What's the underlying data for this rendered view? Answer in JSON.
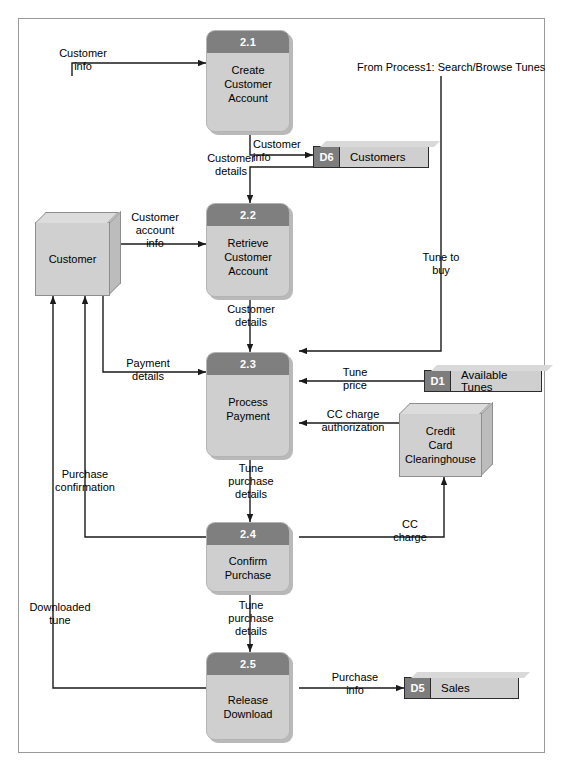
{
  "diagram": {
    "note_top_right": "From Process1: Search/Browse Tunes"
  },
  "colors": {
    "process_header": "#7f7f7f",
    "process_body": "#cfcfcf",
    "entity_fill": "#d0d0d0",
    "store_id_fill": "#7d7d7d",
    "store_name_fill": "#cfcfcf",
    "line": "#1a1a1a",
    "frame_border": "#9a9a9a"
  },
  "processes": [
    {
      "id": "2.1",
      "name": "Create\nCustomer\nAccount"
    },
    {
      "id": "2.2",
      "name": "Retrieve\nCustomer\nAccount"
    },
    {
      "id": "2.3",
      "name": "Process\nPayment"
    },
    {
      "id": "2.4",
      "name": "Confirm\nPurchase"
    },
    {
      "id": "2.5",
      "name": "Release\nDownload"
    }
  ],
  "entities": [
    {
      "key": "customer",
      "name": "Customer"
    },
    {
      "key": "cc_clearinghouse",
      "name": "Credit\nCard\nClearinghouse"
    }
  ],
  "datastores": [
    {
      "id": "D6",
      "name": "Customers"
    },
    {
      "id": "D1",
      "name": "Available Tunes"
    },
    {
      "id": "D5",
      "name": "Sales"
    }
  ],
  "flows": [
    {
      "key": "customer_info_in",
      "label": "Customer\ninfo",
      "from": "customer",
      "to": "2.1"
    },
    {
      "key": "customer_info_store",
      "label": "Customer\ninfo",
      "from": "2.1",
      "to": "D6"
    },
    {
      "key": "customer_details_d6",
      "label": "Customer\ndetails",
      "from": "D6",
      "to": "2.2"
    },
    {
      "key": "customer_account_info",
      "label": "Customer\naccount\ninfo",
      "from": "customer",
      "to": "2.2"
    },
    {
      "key": "customer_details_23",
      "label": "Customer\ndetails",
      "from": "2.2",
      "to": "2.3"
    },
    {
      "key": "tune_to_buy",
      "label": "Tune to\nbuy",
      "from": "Process1",
      "to": "2.3"
    },
    {
      "key": "payment_details",
      "label": "Payment\ndetails",
      "from": "customer",
      "to": "2.3"
    },
    {
      "key": "tune_price",
      "label": "Tune\nprice",
      "from": "D1",
      "to": "2.3"
    },
    {
      "key": "cc_charge_auth",
      "label": "CC charge\nauthorization",
      "from": "cc_clearinghouse",
      "to": "2.3"
    },
    {
      "key": "tune_purchase_details_24",
      "label": "Tune\npurchase\ndetails",
      "from": "2.3",
      "to": "2.4"
    },
    {
      "key": "cc_charge",
      "label": "CC\ncharge",
      "from": "2.4",
      "to": "cc_clearinghouse"
    },
    {
      "key": "purchase_confirmation",
      "label": "Purchase\nconfirmation",
      "from": "2.4",
      "to": "customer"
    },
    {
      "key": "tune_purchase_details_25",
      "label": "Tune\npurchase\ndetails",
      "from": "2.4",
      "to": "2.5"
    },
    {
      "key": "purchase_info",
      "label": "Purchase\ninfo",
      "from": "2.5",
      "to": "D5"
    },
    {
      "key": "downloaded_tune",
      "label": "Downloaded\ntune",
      "from": "2.5",
      "to": "customer"
    }
  ]
}
